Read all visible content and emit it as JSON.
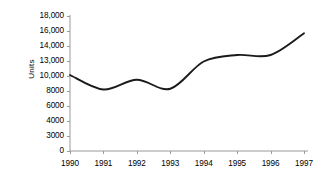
{
  "chart_data": {
    "type": "line",
    "title": "",
    "xlabel": "",
    "ylabel": "Units",
    "categories": [
      "1990",
      "1991",
      "1992",
      "1993",
      "1994",
      "1995",
      "1996",
      "1997"
    ],
    "series": [
      {
        "name": "Units",
        "values": [
          10200,
          8200,
          9500,
          8300,
          12900,
          13400,
          13400,
          15700
        ]
      }
    ],
    "y_tick_labels": [
      "0",
      "3000",
      "4000",
      "6000",
      "8000",
      "10,000",
      "13,000",
      "14,000",
      "16,000",
      "18,000"
    ],
    "y_tick_values": [
      0,
      3000,
      4000,
      6000,
      8000,
      10000,
      13000,
      14000,
      16000,
      18000
    ],
    "x_tick_labels": [
      "1990",
      "1991",
      "1992",
      "1993",
      "1994",
      "1995",
      "1996",
      "1997"
    ],
    "ylim": [
      0,
      18000
    ],
    "grid": false,
    "legend": "none",
    "line_color": "#1a1a1a",
    "axis_color": "#9a9a9a",
    "background": "#ffffff",
    "smoothing": "spline",
    "annotations": []
  },
  "axis": {
    "y_title": "Units"
  }
}
